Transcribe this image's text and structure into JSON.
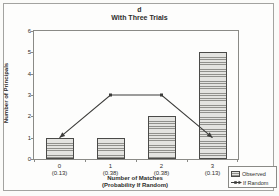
{
  "figure": {
    "title": "d",
    "subtitle": "With Three Trials"
  },
  "chart_data": {
    "type": "bar",
    "title": "d",
    "subtitle": "With Three Trials",
    "categories": [
      "0",
      "1",
      "2",
      "3"
    ],
    "category_sublabels": [
      "(0.13)",
      "(0.38)",
      "(0.38)",
      "(0.13)"
    ],
    "series": [
      {
        "name": "Observed",
        "type": "bar",
        "values": [
          1,
          1,
          2,
          5
        ]
      },
      {
        "name": "If Random",
        "type": "line",
        "values": [
          1,
          3,
          3,
          1
        ]
      }
    ],
    "xlabel": "Number of Matches",
    "xlabel_line2": "(Probability If Random)",
    "ylabel": "Number of Principals",
    "ylim": [
      0,
      6
    ],
    "yticks": [
      0,
      1,
      2,
      3,
      4,
      5,
      6
    ],
    "grid": false,
    "legend_position": "bottom-right"
  },
  "legend": {
    "items": [
      {
        "label": "Observed",
        "marker": "hatched-bar-swatch"
      },
      {
        "label": "If Random",
        "marker": "arrow-line-marker"
      }
    ]
  },
  "colors": {
    "background": "#fdfdfc",
    "figure_border": "#a3a3a0",
    "plot_border": "#8a8a86",
    "bar_fill": "#e3e3e0",
    "bar_stripe": "#90908c",
    "bar_border": "#4a4a48",
    "line": "#3c3c3a",
    "text": "#2e2e2c"
  }
}
